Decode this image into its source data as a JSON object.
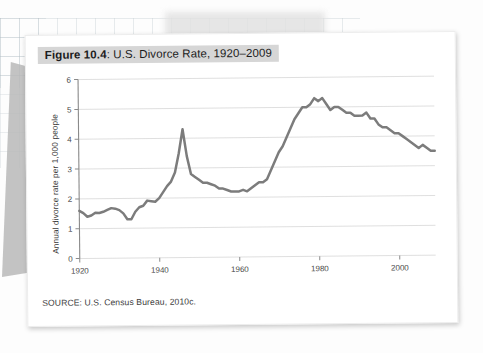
{
  "figure": {
    "label": "Figure 10.4",
    "title_rest": ": U.S. Divorce Rate, 1920–2009",
    "source": "SOURCE: U.S. Census Bureau, 2010c."
  },
  "colors": {
    "line": "#7c7c7c",
    "grid": "#dcdcdc",
    "axis": "#8a8a8a",
    "title_highlight": "#d6d6d6",
    "card": "#ffffff"
  },
  "chart_data": {
    "type": "line",
    "title": "Figure 10.4: U.S. Divorce Rate, 1920–2009",
    "xlabel": "",
    "ylabel": "Annual divorce rate per 1,000 people",
    "xlim": [
      1920,
      2009
    ],
    "ylim": [
      0,
      6
    ],
    "xticks": [
      1920,
      1940,
      1960,
      1980,
      2000
    ],
    "yticks": [
      0,
      1,
      2,
      3,
      4,
      5,
      6
    ],
    "grid": true,
    "legend": null,
    "series": [
      {
        "name": "Annual divorce rate per 1,000 people",
        "x": [
          1920,
          1921,
          1922,
          1923,
          1924,
          1925,
          1926,
          1927,
          1928,
          1929,
          1930,
          1931,
          1932,
          1933,
          1934,
          1935,
          1936,
          1937,
          1938,
          1939,
          1940,
          1941,
          1942,
          1943,
          1944,
          1945,
          1946,
          1947,
          1948,
          1949,
          1950,
          1951,
          1952,
          1953,
          1954,
          1955,
          1956,
          1957,
          1958,
          1959,
          1960,
          1961,
          1962,
          1963,
          1964,
          1965,
          1966,
          1967,
          1968,
          1969,
          1970,
          1971,
          1972,
          1973,
          1974,
          1975,
          1976,
          1977,
          1978,
          1979,
          1980,
          1981,
          1982,
          1983,
          1984,
          1985,
          1986,
          1987,
          1988,
          1989,
          1990,
          1991,
          1992,
          1993,
          1994,
          1995,
          1996,
          1997,
          1998,
          1999,
          2000,
          2001,
          2002,
          2003,
          2004,
          2005,
          2006,
          2007,
          2008,
          2009
        ],
        "values": [
          1.6,
          1.52,
          1.4,
          1.44,
          1.53,
          1.52,
          1.56,
          1.62,
          1.68,
          1.66,
          1.61,
          1.5,
          1.3,
          1.3,
          1.55,
          1.7,
          1.75,
          1.92,
          1.9,
          1.88,
          2.0,
          2.2,
          2.4,
          2.55,
          2.85,
          3.5,
          4.3,
          3.4,
          2.8,
          2.7,
          2.6,
          2.5,
          2.5,
          2.45,
          2.4,
          2.3,
          2.3,
          2.25,
          2.2,
          2.2,
          2.2,
          2.25,
          2.2,
          2.3,
          2.4,
          2.5,
          2.5,
          2.6,
          2.9,
          3.2,
          3.5,
          3.7,
          4.0,
          4.3,
          4.6,
          4.8,
          5.0,
          5.0,
          5.1,
          5.3,
          5.2,
          5.3,
          5.1,
          4.9,
          5.0,
          5.0,
          4.9,
          4.8,
          4.8,
          4.7,
          4.7,
          4.7,
          4.8,
          4.6,
          4.6,
          4.4,
          4.3,
          4.3,
          4.2,
          4.1,
          4.1,
          4.0,
          3.9,
          3.8,
          3.7,
          3.6,
          3.7,
          3.6,
          3.5,
          3.5
        ]
      }
    ]
  }
}
